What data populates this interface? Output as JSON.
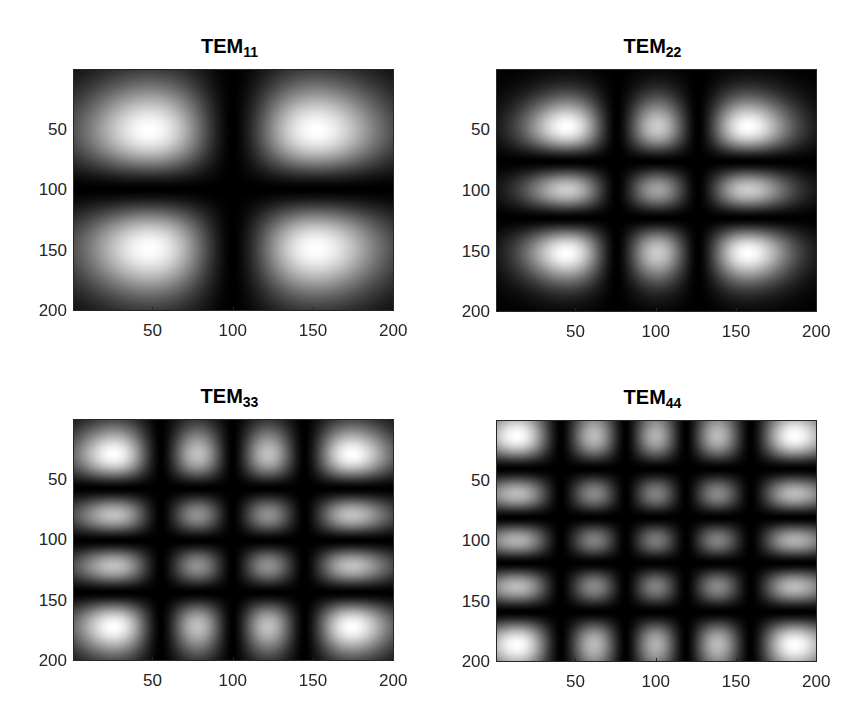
{
  "figure": {
    "background": "#ffffff",
    "axis_color": "#262626",
    "colormap": "gray"
  },
  "chart_data": [
    {
      "type": "heatmap",
      "title": "TEM11",
      "title_main": "TEM",
      "title_sub": "11",
      "mode_m": 1,
      "mode_n": 1,
      "xlabel": "",
      "ylabel": "",
      "xlim": [
        1,
        200
      ],
      "ylim": [
        1,
        200
      ],
      "y_direction": "reverse",
      "xticks": [
        50,
        100,
        150,
        200
      ],
      "yticks": [
        50,
        100,
        150,
        200
      ],
      "grid": false,
      "waist_x": 74,
      "waist_y": 70,
      "center": [
        100,
        100
      ],
      "lobe_grid": "2x2",
      "lobe_centers_x": [
        62,
        138
      ],
      "lobe_centers_y": [
        65,
        135
      ]
    },
    {
      "type": "heatmap",
      "title": "TEM22",
      "title_main": "TEM",
      "title_sub": "22",
      "mode_m": 2,
      "mode_n": 2,
      "xlabel": "",
      "ylabel": "",
      "xlim": [
        1,
        200
      ],
      "ylim": [
        1,
        200
      ],
      "y_direction": "reverse",
      "xticks": [
        50,
        100,
        150,
        200
      ],
      "yticks": [
        50,
        100,
        150,
        200
      ],
      "grid": false,
      "waist_x": 51,
      "waist_y": 47,
      "center": [
        101,
        100
      ],
      "lobe_grid": "3x3",
      "lobe_centers_x": [
        44,
        101,
        158
      ],
      "lobe_centers_y": [
        47,
        100,
        153
      ]
    },
    {
      "type": "heatmap",
      "title": "TEM33",
      "title_main": "TEM",
      "title_sub": "33",
      "mode_m": 3,
      "mode_n": 3,
      "xlabel": "",
      "ylabel": "",
      "xlim": [
        1,
        200
      ],
      "ylim": [
        1,
        200
      ],
      "y_direction": "reverse",
      "xticks": [
        50,
        100,
        150,
        200
      ],
      "yticks": [
        50,
        100,
        150,
        200
      ],
      "grid": false,
      "waist_x": 52,
      "waist_y": 50,
      "center": [
        100,
        101
      ],
      "lobe_grid": "4x4",
      "lobe_centers_x": [
        27,
        79,
        121,
        173
      ],
      "lobe_centers_y": [
        30,
        80,
        121,
        172
      ]
    },
    {
      "type": "heatmap",
      "title": "TEM44",
      "title_main": "TEM",
      "title_sub": "44",
      "mode_m": 4,
      "mode_n": 4,
      "xlabel": "",
      "ylabel": "",
      "xlim": [
        1,
        200
      ],
      "ylim": [
        1,
        200
      ],
      "y_direction": "reverse",
      "xticks": [
        50,
        100,
        150,
        200
      ],
      "yticks": [
        50,
        100,
        150,
        200
      ],
      "grid": false,
      "waist_x": 51,
      "waist_y": 51,
      "center": [
        100,
        100
      ],
      "lobe_grid": "5x5",
      "lobe_centers_x": [
        15,
        60,
        100,
        140,
        185
      ],
      "lobe_centers_y": [
        15,
        58,
        100,
        142,
        185
      ]
    }
  ],
  "layout": {
    "panels": [
      {
        "box": [
          73,
          69,
          321,
          242
        ]
      },
      {
        "box": [
          496,
          69,
          321,
          243
        ]
      },
      {
        "box": [
          73,
          419,
          321,
          242
        ]
      },
      {
        "box": [
          496,
          420,
          321,
          242
        ]
      }
    ]
  }
}
